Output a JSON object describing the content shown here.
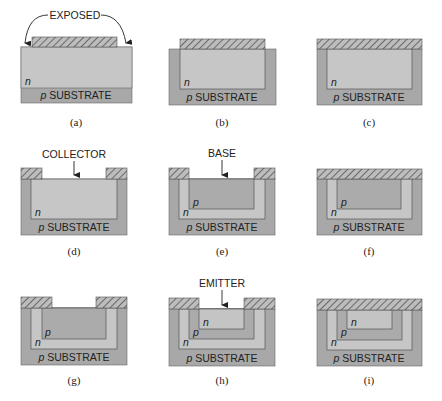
{
  "figure": {
    "labels": {
      "exposed": "EXPOSED",
      "collector": "COLLECTOR",
      "base": "BASE",
      "emitter": "EMITTER",
      "substrate_prefix": "p",
      "substrate": "SUBSTRATE",
      "n": "n",
      "p": "p"
    },
    "panels": [
      {
        "id": "a",
        "caption": "(a)",
        "step": "n layer with oxide mask; edges exposed"
      },
      {
        "id": "b",
        "caption": "(b)",
        "step": "isolation diffusion"
      },
      {
        "id": "c",
        "caption": "(c)",
        "step": "oxide regrown"
      },
      {
        "id": "d",
        "caption": "(d)",
        "step": "collector window opened"
      },
      {
        "id": "e",
        "caption": "(e)",
        "step": "p base diffused"
      },
      {
        "id": "f",
        "caption": "(f)",
        "step": "oxide regrown"
      },
      {
        "id": "g",
        "caption": "(g)",
        "step": "emitter window opened"
      },
      {
        "id": "h",
        "caption": "(h)",
        "step": "n emitter diffused"
      },
      {
        "id": "i",
        "caption": "(i)",
        "step": "oxide regrown"
      }
    ],
    "colors": {
      "substrate": "#a8a8a8",
      "n_region": "#c6c6c6",
      "p_region": "#ababab",
      "emitter_n": "#c4c4c4",
      "oxide_bg": "#bdbdbd",
      "outline": "#555555"
    }
  }
}
